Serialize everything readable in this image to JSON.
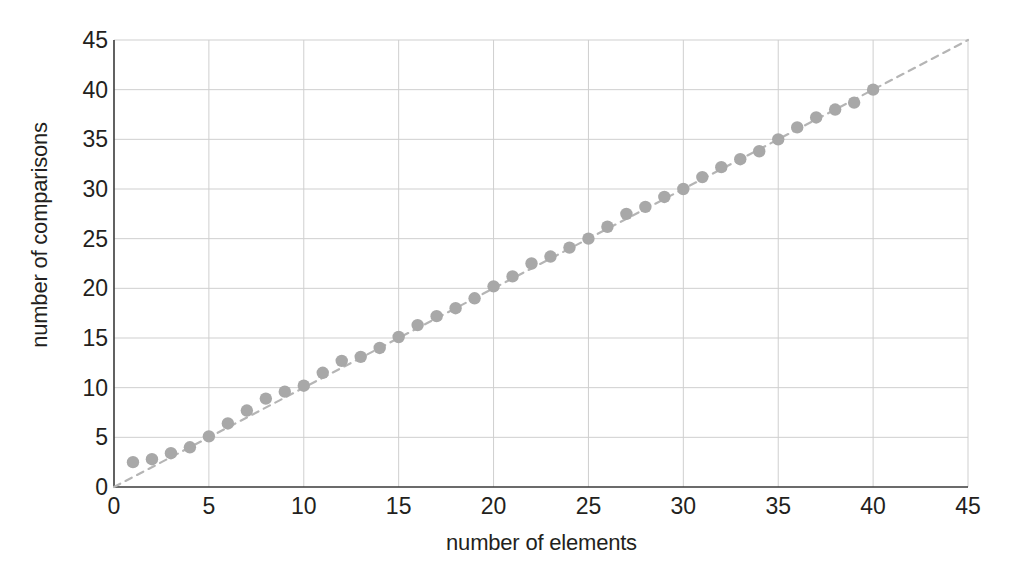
{
  "chart_data": {
    "type": "scatter",
    "title": "",
    "xlabel": "number of elements",
    "ylabel": "number of comparisons",
    "xlim": [
      0,
      45
    ],
    "ylim": [
      0,
      45
    ],
    "xticks": [
      0,
      5,
      10,
      15,
      20,
      25,
      30,
      35,
      40,
      45
    ],
    "yticks": [
      0,
      5,
      10,
      15,
      20,
      25,
      30,
      35,
      40,
      45
    ],
    "grid": true,
    "legend": null,
    "series": [
      {
        "name": "measured comparisons",
        "marker": "filled-circle",
        "color": "#a8a8a8",
        "x": [
          1,
          2,
          3,
          4,
          5,
          6,
          7,
          8,
          9,
          10,
          11,
          12,
          13,
          14,
          15,
          16,
          17,
          18,
          19,
          20,
          21,
          22,
          23,
          24,
          25,
          26,
          27,
          28,
          29,
          30,
          31,
          32,
          33,
          34,
          35,
          36,
          37,
          38,
          39,
          40
        ],
        "y": [
          2.5,
          2.8,
          3.4,
          4.0,
          5.1,
          6.4,
          7.7,
          8.9,
          9.6,
          10.2,
          11.5,
          12.7,
          13.1,
          14.0,
          15.1,
          16.3,
          17.2,
          18.0,
          19.0,
          20.2,
          21.2,
          22.5,
          23.2,
          24.1,
          25.0,
          26.2,
          27.5,
          28.2,
          29.2,
          30.0,
          31.2,
          32.2,
          33.0,
          33.8,
          35.0,
          36.2,
          37.2,
          38.0,
          38.7,
          40.0
        ]
      },
      {
        "name": "ideal linear reference",
        "marker": "none",
        "linestyle": "dashed",
        "color": "#b5b5b5",
        "x": [
          0,
          45
        ],
        "y": [
          0,
          45
        ]
      }
    ]
  },
  "axes": {
    "x_tick_labels": [
      "0",
      "5",
      "10",
      "15",
      "20",
      "25",
      "30",
      "35",
      "40",
      "45"
    ],
    "y_tick_labels": [
      "0",
      "5",
      "10",
      "15",
      "20",
      "25",
      "30",
      "35",
      "40",
      "45"
    ],
    "x_title": "number of elements",
    "y_title": "number of comparisons"
  },
  "colors": {
    "marker": "#a8a8a8",
    "trend_line": "#b5b5b5",
    "grid": "#cfcfcf",
    "axis": "#3a3a3a",
    "text": "#231f20",
    "background": "#ffffff"
  }
}
